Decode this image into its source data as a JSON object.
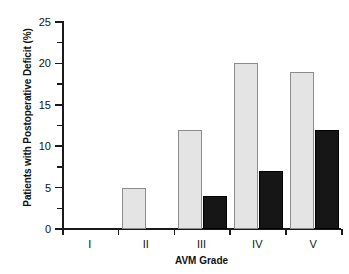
{
  "chart_data": {
    "type": "bar",
    "title": "",
    "xlabel": "AVM Grade",
    "ylabel": "Patients with Postoperative Deficit (%)",
    "categories": [
      "I",
      "II",
      "III",
      "IV",
      "V"
    ],
    "series": [
      {
        "name": "light",
        "color": "#e4e4e4",
        "values": [
          0,
          5,
          12,
          20,
          19
        ]
      },
      {
        "name": "dark",
        "color": "#161616",
        "values": [
          0,
          0,
          4,
          7,
          12
        ]
      }
    ],
    "ylim": [
      0,
      25
    ],
    "ytick_labels": [
      "0",
      "5",
      "10",
      "15",
      "20",
      "25"
    ],
    "ytick_values": [
      0,
      5,
      10,
      15,
      20,
      25
    ],
    "yminor_values": [
      2.5,
      7.5,
      12.5,
      17.5,
      22.5
    ],
    "grid": false,
    "legend": "none"
  },
  "axes": {
    "y_title": "Patients with Postoperative Deficit (%)",
    "x_title": "AVM Grade"
  }
}
